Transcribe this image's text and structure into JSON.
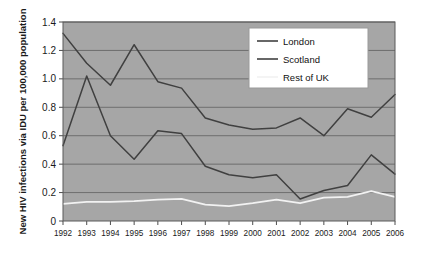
{
  "chart_data": {
    "type": "line",
    "title": "",
    "xlabel": "",
    "ylabel": "New HIV infections via IDU per 100,000 population",
    "categories": [
      "1992",
      "1993",
      "1994",
      "1995",
      "1996",
      "1997",
      "1998",
      "1999",
      "2000",
      "2001",
      "2002",
      "2003",
      "2004",
      "2005",
      "2006"
    ],
    "ylim": [
      0,
      1.4
    ],
    "ytick_labels": [
      "1.4",
      "1.2",
      "1.0",
      "0.8",
      "0.6",
      "0.4",
      "0.2",
      "0"
    ],
    "ytick_values": [
      1.4,
      1.2,
      1.0,
      0.8,
      0.6,
      0.4,
      0.2,
      0
    ],
    "grid": true,
    "grid_axis": "y",
    "legend_position": "upper-right-inside",
    "plot_background": "#a6a6a6",
    "series": [
      {
        "name": "London",
        "color": "#404040",
        "values": [
          1.32,
          1.11,
          0.955,
          1.24,
          0.98,
          0.935,
          0.725,
          0.675,
          0.645,
          0.655,
          0.725,
          0.6,
          0.79,
          0.73,
          0.89
        ]
      },
      {
        "name": "Scotland",
        "color": "#404040",
        "values": [
          0.53,
          1.02,
          0.6,
          0.435,
          0.635,
          0.615,
          0.385,
          0.325,
          0.305,
          0.325,
          0.155,
          0.215,
          0.25,
          0.465,
          0.33
        ]
      },
      {
        "name": "Rest of UK",
        "color": "#f2f2f2",
        "values": [
          0.12,
          0.135,
          0.135,
          0.14,
          0.15,
          0.155,
          0.115,
          0.105,
          0.125,
          0.15,
          0.125,
          0.165,
          0.17,
          0.21,
          0.17
        ]
      }
    ]
  },
  "legend": {
    "items": [
      {
        "label": "London"
      },
      {
        "label": "Scotland"
      },
      {
        "label": "Rest of UK"
      }
    ]
  }
}
